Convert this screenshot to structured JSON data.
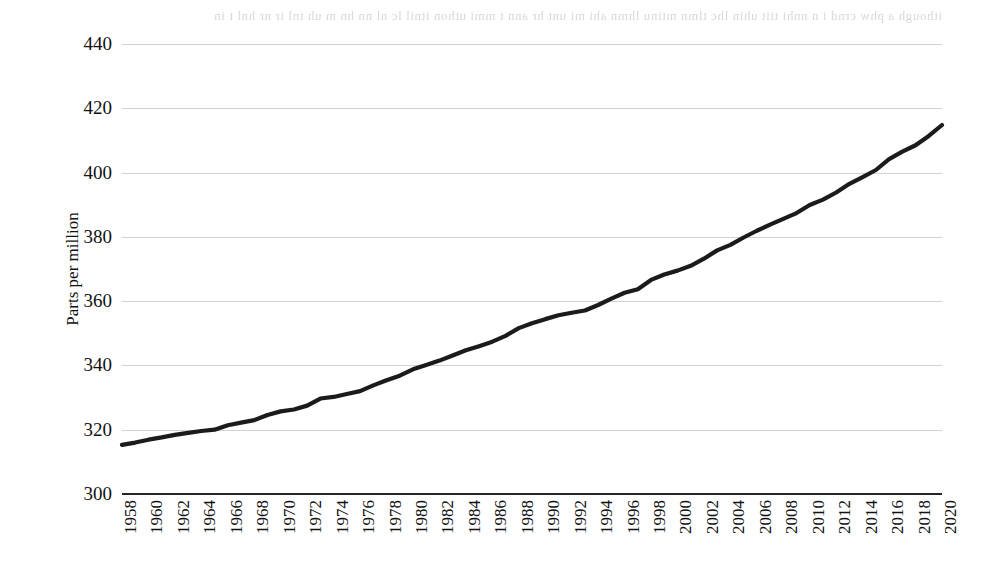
{
  "figure": {
    "background": "#ffffff",
    "line_color": "#1b1b1b",
    "grid_color": "#d2d2d2",
    "axis_color": "#262626",
    "bleed_through_text": "ithough a phw crnd  i n   nnhi  tiit   uhin  lhc tlmn  mtinu  lhmn  ahi  mi   unt hr ann  t mmi  uthon  itnil  lc nl nn  hn m  uh  tnl ir nr  hnl t in"
  },
  "chart_data": {
    "type": "line",
    "title": "",
    "xlabel": "",
    "ylabel": "Parts per million",
    "ylim": [
      300,
      440
    ],
    "yticks": [
      300,
      320,
      340,
      360,
      380,
      400,
      420,
      440
    ],
    "ytick_labels": [
      "300",
      "320",
      "340",
      "360",
      "380",
      "400",
      "420",
      "440"
    ],
    "xlim": [
      1958,
      2020
    ],
    "xticks": [
      1958,
      1960,
      1962,
      1964,
      1966,
      1968,
      1970,
      1972,
      1974,
      1976,
      1978,
      1980,
      1982,
      1984,
      1986,
      1988,
      1990,
      1992,
      1994,
      1996,
      1998,
      2000,
      2002,
      2004,
      2006,
      2008,
      2010,
      2012,
      2014,
      2016,
      2018,
      2020
    ],
    "xtick_labels": [
      "1958",
      "1960",
      "1962",
      "1964",
      "1966",
      "1968",
      "1970",
      "1972",
      "1974",
      "1976",
      "1978",
      "1980",
      "1982",
      "1984",
      "1986",
      "1988",
      "1990",
      "1992",
      "1994",
      "1996",
      "1998",
      "2000",
      "2002",
      "2004",
      "2006",
      "2008",
      "2010",
      "2012",
      "2014",
      "2016",
      "2018",
      "2020"
    ],
    "grid": "horizontal",
    "legend": "none",
    "x": [
      1958,
      1959,
      1960,
      1961,
      1962,
      1963,
      1964,
      1965,
      1966,
      1967,
      1968,
      1969,
      1970,
      1971,
      1972,
      1973,
      1974,
      1975,
      1976,
      1977,
      1978,
      1979,
      1980,
      1981,
      1982,
      1983,
      1984,
      1985,
      1986,
      1987,
      1988,
      1989,
      1990,
      1991,
      1992,
      1993,
      1994,
      1995,
      1996,
      1997,
      1998,
      1999,
      2000,
      2001,
      2002,
      2003,
      2004,
      2005,
      2006,
      2007,
      2008,
      2009,
      2010,
      2011,
      2012,
      2013,
      2014,
      2015,
      2016,
      2017,
      2018,
      2019,
      2020
    ],
    "values": [
      315.3,
      316.0,
      316.9,
      317.6,
      318.4,
      319.0,
      319.6,
      320.0,
      321.4,
      322.2,
      323.0,
      324.6,
      325.7,
      326.3,
      327.5,
      329.7,
      330.2,
      331.1,
      332.0,
      333.8,
      335.4,
      336.8,
      338.8,
      340.1,
      341.5,
      343.1,
      344.7,
      346.0,
      347.4,
      349.2,
      351.6,
      353.1,
      354.4,
      355.6,
      356.4,
      357.1,
      358.8,
      360.8,
      362.6,
      363.7,
      366.6,
      368.3,
      369.5,
      371.0,
      373.2,
      375.8,
      377.5,
      379.8,
      381.9,
      383.8,
      385.6,
      387.4,
      389.9,
      391.6,
      393.8,
      396.5,
      398.6,
      400.8,
      404.2,
      406.5,
      408.5,
      411.4,
      414.8
    ],
    "series_name": "Atmospheric CO2 concentration",
    "units": "ppm"
  }
}
